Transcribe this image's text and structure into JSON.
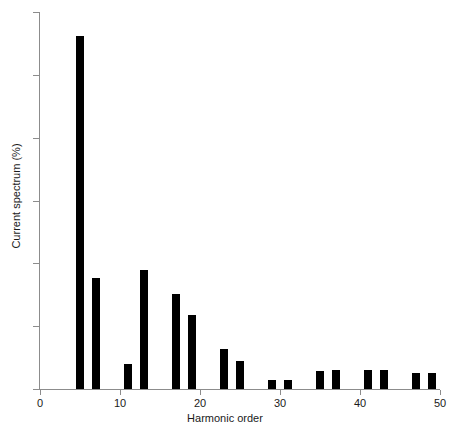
{
  "chart_data": {
    "type": "bar",
    "title": "",
    "xlabel": "Harmonic order",
    "ylabel": "Current spectrum (%)",
    "xlim": [
      0,
      50
    ],
    "ylim": [
      0,
      6
    ],
    "xticks": [
      0,
      10,
      20,
      30,
      40,
      50
    ],
    "yticks": [
      0,
      1,
      2,
      3,
      4,
      5,
      6
    ],
    "grid": false,
    "legend": null,
    "bar_color": "#000000",
    "axis_color": "#8c8c8c",
    "bar_width": 1.0,
    "categories": [
      5,
      7,
      11,
      13,
      17,
      19,
      23,
      25,
      29,
      31,
      35,
      37,
      41,
      43,
      47,
      49
    ],
    "values": [
      5.62,
      1.76,
      0.4,
      1.89,
      1.52,
      1.18,
      0.63,
      0.45,
      0.15,
      0.14,
      0.28,
      0.3,
      0.3,
      0.3,
      0.26,
      0.26
    ],
    "points": [
      {
        "x": 5,
        "y": 5.62
      },
      {
        "x": 7,
        "y": 1.76
      },
      {
        "x": 11,
        "y": 0.4
      },
      {
        "x": 13,
        "y": 1.89
      },
      {
        "x": 17,
        "y": 1.52
      },
      {
        "x": 19,
        "y": 1.18
      },
      {
        "x": 23,
        "y": 0.63
      },
      {
        "x": 25,
        "y": 0.45
      },
      {
        "x": 29,
        "y": 0.15
      },
      {
        "x": 31,
        "y": 0.14
      },
      {
        "x": 35,
        "y": 0.28
      },
      {
        "x": 37,
        "y": 0.3
      },
      {
        "x": 41,
        "y": 0.3
      },
      {
        "x": 43,
        "y": 0.3
      },
      {
        "x": 47,
        "y": 0.26
      },
      {
        "x": 49,
        "y": 0.26
      }
    ]
  }
}
